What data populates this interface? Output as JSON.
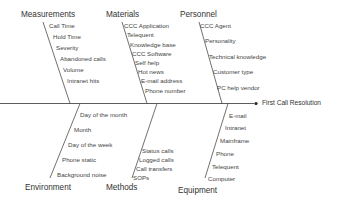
{
  "diagram": {
    "type": "fishbone",
    "effect": "First Call Resolution",
    "line_color": "#333333",
    "categories": {
      "measurements": {
        "label": "Measurements",
        "causes": [
          "Call Time",
          "Hold Time",
          "Severity",
          "Abandoned calls",
          "Volume",
          "Intranet hits"
        ]
      },
      "materials": {
        "label": "Materials",
        "causes": [
          "CCC Application",
          "Telequent",
          "Knowledge base",
          "CCC Software",
          "Self help",
          "Hot news",
          "E-mail address",
          "Phone number"
        ]
      },
      "personnel": {
        "label": "Personnel",
        "causes": [
          "CCC Agent",
          "Personality",
          "Technical knowledge",
          "Customer type",
          "PC help vendor"
        ]
      },
      "environment": {
        "label": "Environment",
        "causes": [
          "Day of the month",
          "Month",
          "Day of the week",
          "Phone static",
          "Background noise"
        ]
      },
      "methods": {
        "label": "Methods",
        "causes": [
          "Status calls",
          "Logged calls",
          "Call transfers",
          "SOPs"
        ]
      },
      "equipment": {
        "label": "Equipment",
        "causes": [
          "E-mail",
          "Intranet",
          "Mainframe",
          "Phone",
          "Telequent",
          "Computer"
        ]
      }
    }
  }
}
